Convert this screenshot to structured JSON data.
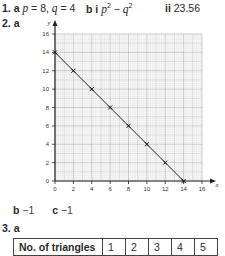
{
  "q1": {
    "label": "1.",
    "a_label": "a",
    "a_p": "p",
    "a_p_val": " = 8, ",
    "a_q": "q",
    "a_q_val": " = 4",
    "b_label": "b",
    "b_i": "i",
    "b_expr_p": "p",
    "b_expr_minus": " − ",
    "b_expr_q": "q",
    "sup": "2",
    "ii_label": "ii",
    "ii_val": "23.56"
  },
  "q2": {
    "label": "2. a",
    "b_label": "b",
    "b_val": "−1",
    "c_label": "c",
    "c_val": "−1"
  },
  "q3": {
    "label": "3. a",
    "table": {
      "header": "No. of triangles",
      "values": [
        "1",
        "2",
        "3",
        "4",
        "5"
      ]
    }
  },
  "chart_data": {
    "type": "line",
    "title": "",
    "xlabel": "x",
    "ylabel": "y",
    "x": [
      0,
      2,
      4,
      6,
      8,
      10,
      12,
      14
    ],
    "values": [
      14,
      12,
      10,
      8,
      6,
      4,
      2,
      0
    ],
    "xticks": [
      "0",
      "2",
      "4",
      "6",
      "8",
      "10",
      "12",
      "14",
      "16"
    ],
    "yticks": [
      "0",
      "2",
      "4",
      "6",
      "8",
      "10",
      "12",
      "14",
      "16"
    ],
    "xlim": [
      0,
      16
    ],
    "ylim": [
      0,
      16
    ],
    "grid": true,
    "markers": "x"
  }
}
